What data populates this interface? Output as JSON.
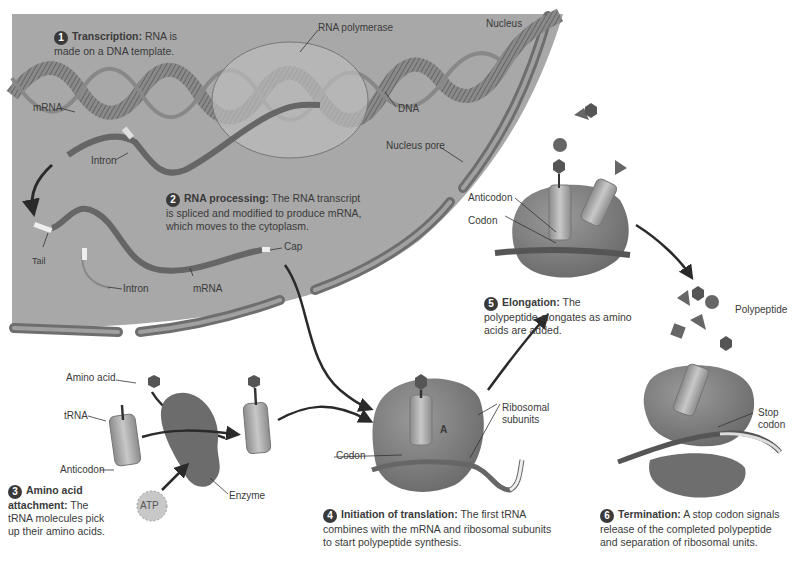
{
  "diagram": {
    "colors": {
      "nucleus_fill": "#a8a8a8",
      "membrane": "#6e6e6e",
      "molecule_dark": "#5c5c5c",
      "ribosome": "#7a7a7a",
      "trna": "#b5b5b5",
      "background": "#ffffff"
    },
    "regions": {
      "nucleus": "Nucleus",
      "nucleus_pore": "Nucleus pore"
    },
    "labels": {
      "rna_polymerase": "RNA polymerase",
      "dna": "DNA",
      "mrna_top": "mRNA",
      "intron_top": "Intron",
      "tail": "Tail",
      "intron_mid": "Intron",
      "mrna_mid": "mRNA",
      "cap": "Cap",
      "amino_acid": "Amino acid",
      "trna": "tRNA",
      "anticodon_left": "Anticodon",
      "enzyme": "Enzyme",
      "atp": "ATP",
      "codon_init": "Codon",
      "a_site": "A",
      "ribosomal_subunits_line1": "Ribosomal",
      "ribosomal_subunits_line2": "subunits",
      "anticodon_elong": "Anticodon",
      "codon_elong": "Codon",
      "polypeptide": "Polypeptide",
      "stop_codon_line1": "Stop",
      "stop_codon_line2": "codon"
    },
    "steps": [
      {
        "number": "1",
        "title": "Transcription:",
        "text": "RNA is made on a DNA template."
      },
      {
        "number": "2",
        "title": "RNA processing:",
        "text": "The RNA transcript is spliced and modified to produce mRNA, which moves to the cytoplasm."
      },
      {
        "number": "3",
        "title": "Amino acid attachment:",
        "text": "The tRNA molecules pick up their amino acids."
      },
      {
        "number": "4",
        "title": "Initiation of translation:",
        "text": "The first tRNA combines with the mRNA and ribosomal subunits to start polypeptide synthesis."
      },
      {
        "number": "5",
        "title": "Elongation:",
        "text": "The polypeptide elongates as amino acids are added."
      },
      {
        "number": "6",
        "title": "Termination:",
        "text": "A stop codon signals release of the completed polypeptide and separation of ribosomal units."
      }
    ]
  }
}
